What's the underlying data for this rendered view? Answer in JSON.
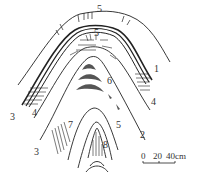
{
  "figure": {
    "type": "geological fold cross-section",
    "colors": {
      "line": "#222222",
      "fill_dark": "#555555",
      "background": "#ffffff"
    }
  },
  "labels": [
    {
      "text": "5",
      "x": 97,
      "y": 4
    },
    {
      "text": "5",
      "x": 94,
      "y": 28
    },
    {
      "text": "1",
      "x": 154,
      "y": 64
    },
    {
      "text": "6",
      "x": 107,
      "y": 76
    },
    {
      "text": "4",
      "x": 151,
      "y": 97
    },
    {
      "text": "3",
      "x": 10,
      "y": 112
    },
    {
      "text": "4",
      "x": 32,
      "y": 108
    },
    {
      "text": "5",
      "x": 116,
      "y": 120
    },
    {
      "text": "2",
      "x": 140,
      "y": 130
    },
    {
      "text": "7",
      "x": 68,
      "y": 120
    },
    {
      "text": "3",
      "x": 34,
      "y": 147
    },
    {
      "text": "8",
      "x": 103,
      "y": 140
    }
  ],
  "scale_bar": {
    "ticks": [
      "0",
      "20",
      "40cm"
    ],
    "label": "0  20  40cm"
  }
}
